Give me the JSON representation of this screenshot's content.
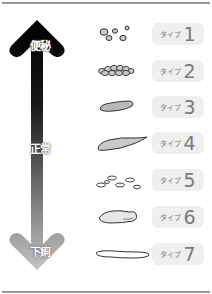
{
  "scale": {
    "top_label": "便秘",
    "middle_label": "正常",
    "bottom_label": "下痢",
    "gradient": {
      "top": "#000000",
      "bottom": "#bdbdbd"
    }
  },
  "types": [
    {
      "word": "タイプ",
      "number": "1",
      "shape": "separate-hard-lumps"
    },
    {
      "word": "タイプ",
      "number": "2",
      "shape": "lumpy-sausage"
    },
    {
      "word": "タイプ",
      "number": "3",
      "shape": "sausage-with-cracks"
    },
    {
      "word": "タイプ",
      "number": "4",
      "shape": "smooth-snake"
    },
    {
      "word": "タイプ",
      "number": "5",
      "shape": "soft-blobs"
    },
    {
      "word": "タイプ",
      "number": "6",
      "shape": "mushy-pieces"
    },
    {
      "word": "タイプ",
      "number": "7",
      "shape": "watery"
    }
  ],
  "colors": {
    "badge_bg": "#efefef",
    "badge_text": "#7a7a7a",
    "stool_fill": "#c9c9c9",
    "stool_stroke": "#333333"
  }
}
